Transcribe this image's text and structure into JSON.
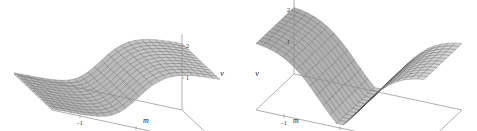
{
  "figure": {
    "caption": "",
    "background_color": "#ffffff",
    "panel_count": 2
  },
  "chart_data": [
    {
      "id": "left-panel",
      "type": "surface",
      "title": "",
      "subtitle": "",
      "xlabel": "m",
      "ylabel": "",
      "zlabel": "v",
      "xticks": [
        "-1",
        "0",
        "1"
      ],
      "xtick_values": [
        -1,
        0,
        1
      ],
      "zticks": [
        "1",
        "2"
      ],
      "ztick_values": [
        1,
        2
      ],
      "xlim": [
        -1.5,
        1.5
      ],
      "ylim": [
        0,
        1
      ],
      "zlim": [
        0,
        2.4
      ],
      "grid": false,
      "legend": "none",
      "surface_shape": "monotonic-sigmoid-ramp",
      "description": "Smooth surface rising monotonically from a low flat plateau at negative m to a high plateau at positive m",
      "mesh": {
        "nx": 26,
        "ny": 13
      },
      "colors": {
        "face_light": "#d9d9d9",
        "face_dark": "#8f8f8f",
        "mesh_line": "#4a4a4a",
        "axis": "#8c8c8c",
        "text": "#222222"
      },
      "axis_side": "right",
      "x": [
        -1.5,
        -1.38,
        -1.26,
        -1.14,
        -1.02,
        -0.9,
        -0.78,
        -0.66,
        -0.54,
        -0.42,
        -0.3,
        -0.18,
        -0.06,
        0.06,
        0.18,
        0.3,
        0.42,
        0.54,
        0.66,
        0.78,
        0.9,
        1.02,
        1.14,
        1.26,
        1.38,
        1.5
      ],
      "v": [
        0.04,
        0.04,
        0.05,
        0.05,
        0.06,
        0.07,
        0.09,
        0.12,
        0.17,
        0.25,
        0.38,
        0.56,
        0.78,
        1.02,
        1.26,
        1.47,
        1.64,
        1.78,
        1.88,
        1.95,
        2.0,
        2.04,
        2.06,
        2.08,
        2.09,
        2.1
      ]
    },
    {
      "id": "right-panel",
      "type": "surface",
      "title": "",
      "subtitle": "",
      "xlabel": "m",
      "ylabel": "",
      "zlabel": "v",
      "xticks": [
        "-1",
        "0",
        "1"
      ],
      "xtick_values": [
        -1,
        0,
        1
      ],
      "zticks": [
        "1",
        "2"
      ],
      "ztick_values": [
        1,
        2
      ],
      "xlim": [
        -1.5,
        1.5
      ],
      "ylim": [
        0,
        1
      ],
      "zlim": [
        0,
        2.4
      ],
      "grid": false,
      "legend": "none",
      "surface_shape": "symmetric-double-well-valley",
      "description": "Symmetric valley surface with a minimum at m = 0 rising to high plateaus on both sides",
      "mesh": {
        "nx": 26,
        "ny": 13
      },
      "colors": {
        "face_light": "#d9d9d9",
        "face_dark": "#8f8f8f",
        "mesh_line": "#4a4a4a",
        "axis": "#8c8c8c",
        "text": "#222222"
      },
      "axis_side": "left",
      "x": [
        -1.5,
        -1.38,
        -1.26,
        -1.14,
        -1.02,
        -0.9,
        -0.78,
        -0.66,
        -0.54,
        -0.42,
        -0.3,
        -0.18,
        -0.06,
        0.06,
        0.18,
        0.3,
        0.42,
        0.54,
        0.66,
        0.78,
        0.9,
        1.02,
        1.14,
        1.26,
        1.38,
        1.5
      ],
      "v": [
        2.1,
        2.07,
        2.02,
        1.95,
        1.85,
        1.72,
        1.55,
        1.35,
        1.12,
        0.86,
        0.6,
        0.35,
        0.12,
        0.12,
        0.35,
        0.6,
        0.86,
        1.12,
        1.35,
        1.55,
        1.72,
        1.85,
        1.95,
        2.02,
        2.07,
        2.1
      ]
    }
  ]
}
